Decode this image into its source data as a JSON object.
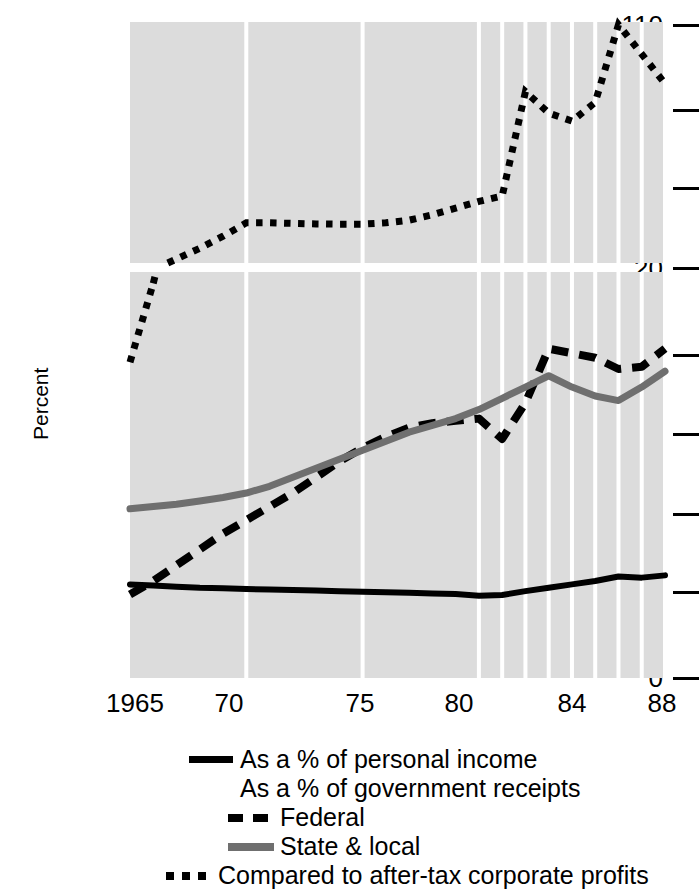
{
  "chart_data": {
    "type": "line",
    "title": "",
    "subtitle": "",
    "xlabel": "",
    "ylabel": "Percent",
    "grid": true,
    "legend_position": "bottom",
    "broken_axis": true,
    "panels": [
      {
        "name": "upper",
        "ylim": [
          20,
          110
        ],
        "yticks": [
          20,
          50,
          80,
          110
        ],
        "ytick_labels": [
          "20",
          "50",
          "80",
          "110"
        ]
      },
      {
        "name": "lower",
        "ylim": [
          0,
          18
        ],
        "yticks": [
          0,
          4,
          8,
          12,
          16
        ],
        "ytick_labels": [
          "0",
          "4",
          "8",
          "12",
          "16"
        ]
      }
    ],
    "x": [
      1965,
      1966,
      1967,
      1968,
      1969,
      1970,
      1971,
      1972,
      1973,
      1974,
      1975,
      1976,
      1977,
      1978,
      1979,
      1980,
      1981,
      1982,
      1983,
      1984,
      1985,
      1986,
      1987,
      1988
    ],
    "xticks": [
      1965,
      1970,
      1975,
      1980,
      1984,
      1988
    ],
    "xtick_labels": [
      "1965",
      "70",
      "75",
      "80",
      "84",
      "88"
    ],
    "xlim": [
      1965,
      1988
    ],
    "gridline_years": [
      1965,
      1970,
      1975,
      1980,
      1981,
      1982,
      1983,
      1984,
      1985,
      1986,
      1987,
      1988
    ],
    "series": [
      {
        "name": "As a % of personal income",
        "key": "personal_income",
        "panel": "lower",
        "style": "solid",
        "color": "#000000",
        "values": [
          4.15,
          4.1,
          4.05,
          4.0,
          3.98,
          3.95,
          3.92,
          3.9,
          3.88,
          3.85,
          3.82,
          3.8,
          3.78,
          3.75,
          3.72,
          3.65,
          3.68,
          3.85,
          4.0,
          4.15,
          4.3,
          4.5,
          4.45,
          4.55
        ]
      },
      {
        "name": "Federal",
        "key": "federal",
        "panel": "lower",
        "style": "dashed",
        "color": "#000000",
        "values": [
          3.7,
          4.3,
          5.0,
          5.7,
          6.4,
          7.0,
          7.6,
          8.2,
          8.9,
          9.6,
          10.2,
          10.7,
          11.1,
          11.3,
          11.4,
          11.5,
          10.6,
          12.2,
          14.6,
          14.4,
          14.2,
          13.7,
          13.8,
          14.6
        ]
      },
      {
        "name": "State & local",
        "key": "state_local",
        "panel": "lower",
        "style": "solid",
        "color": "#6f6f6f",
        "values": [
          7.5,
          7.6,
          7.7,
          7.85,
          8.0,
          8.2,
          8.5,
          8.9,
          9.3,
          9.7,
          10.1,
          10.5,
          10.9,
          11.2,
          11.5,
          11.9,
          12.4,
          12.9,
          13.4,
          12.9,
          12.5,
          12.3,
          12.9,
          13.6
        ]
      },
      {
        "name": "Compared to after-tax corporate profits",
        "key": "corporate_profits",
        "panel": "both",
        "style": "dotted",
        "color": "#000000",
        "values": [
          14.0,
          17.5,
          21.5,
          25.5,
          30.0,
          35.0,
          35.0,
          34.8,
          34.6,
          34.5,
          34.5,
          35.0,
          36.0,
          38.0,
          40.5,
          43.0,
          45.0,
          84.0,
          76.0,
          73.0,
          80.0,
          109.0,
          98.0,
          87.0
        ]
      }
    ]
  },
  "axis": {
    "ylabel": "Percent",
    "upper_ticks": [
      "110",
      "80",
      "50",
      "20"
    ],
    "lower_ticks": [
      "16",
      "12",
      "8",
      "4",
      "0"
    ],
    "x_labels": [
      "1965",
      "70",
      "75",
      "80",
      "84",
      "88"
    ]
  },
  "legend": {
    "rows": [
      {
        "key": "solid",
        "label": "As a % of personal income"
      },
      {
        "key": "none",
        "label": "As a % of government receipts"
      },
      {
        "key": "dashed",
        "label": "Federal"
      },
      {
        "key": "gray",
        "label": "State & local"
      },
      {
        "key": "dotted",
        "label": "Compared to after-tax corporate profits"
      }
    ]
  },
  "colors": {
    "plot_background": "#dcdcdc",
    "gridline": "#ffffff",
    "ink": "#000000",
    "gray_series": "#6f6f6f"
  }
}
